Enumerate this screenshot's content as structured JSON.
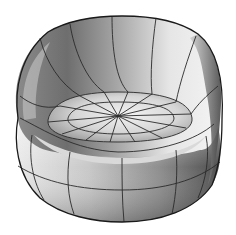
{
  "image": {
    "subject": "3D shaded wireframe rendering of a rounded bucket chair / pod seat",
    "background_color": "#ffffff",
    "line_color": "#2a2a2a",
    "shading": {
      "light": "#f4f4f4",
      "mid": "#bdbdbd",
      "dark": "#6a6a6a",
      "darkest": "#4a4a4a"
    },
    "pole_center": {
      "x": 118,
      "y": 116
    }
  }
}
